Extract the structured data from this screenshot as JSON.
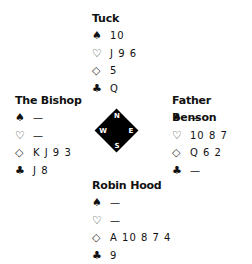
{
  "hands": {
    "north": {
      "name": "Tuck",
      "spades": "10",
      "hearts": "J 9 6",
      "diamonds": "5",
      "clubs": "Q"
    },
    "west": {
      "name": "The Bishop",
      "spades": "—",
      "hearts": "—",
      "diamonds": "K J 9 3",
      "clubs": "J 8"
    },
    "east": {
      "name": "Father Benson",
      "spades": "—",
      "hearts": "10 8 7",
      "diamonds": "Q 6 2",
      "clubs": "—"
    },
    "south": {
      "name": "Robin Hood",
      "spades": "—",
      "hearts": "—",
      "diamonds": "A 10 8 7 4",
      "clubs": "9"
    }
  },
  "suits": {
    "spades": "♠",
    "hearts": "♡",
    "diamonds": "◇",
    "clubs": "♣"
  },
  "compass": {
    "north": "N",
    "south": "S",
    "west": "W",
    "east": "E"
  }
}
